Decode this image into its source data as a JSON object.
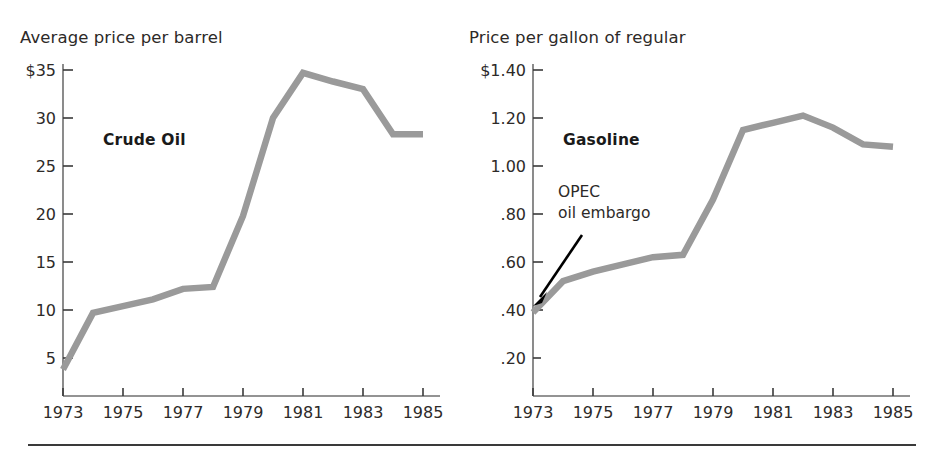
{
  "figure": {
    "background_color": "#ffffff",
    "line_color": "#9a9a9a",
    "text_color": "#2d2a28",
    "rule_color": "#3a3a3a"
  },
  "panels": [
    {
      "key": "crude",
      "title": "Average price per barrel",
      "series_label": "Crude Oil",
      "y_tick_labels": [
        "$35",
        "30",
        "25",
        "20",
        "15",
        "10",
        "5"
      ],
      "x_tick_labels": [
        "1973",
        "1975",
        "1977",
        "1979",
        "1981",
        "1983",
        "1985"
      ]
    },
    {
      "key": "gasoline",
      "title": "Price per gallon of regular",
      "series_label": "Gasoline",
      "annotation_line_1": "OPEC",
      "annotation_line_2": "oil embargo",
      "y_tick_labels": [
        "$1.40",
        "1.20",
        "1.00",
        ".80",
        ".60",
        ".40",
        ".20"
      ],
      "x_tick_labels": [
        "1973",
        "1975",
        "1977",
        "1979",
        "1981",
        "1983",
        "1985"
      ]
    }
  ],
  "chart_data": [
    {
      "type": "line",
      "title": "Average price per barrel",
      "series_name": "Crude Oil",
      "xlabel": "",
      "ylabel": "Average price per barrel",
      "x": [
        1973,
        1974,
        1975,
        1976,
        1977,
        1978,
        1979,
        1980,
        1981,
        1982,
        1983,
        1984,
        1985
      ],
      "values": [
        3.8,
        9.7,
        10.4,
        11.1,
        12.2,
        12.4,
        19.8,
        30.0,
        34.7,
        33.8,
        33.0,
        28.3,
        28.3
      ],
      "x_ticks": [
        1973,
        1975,
        1977,
        1979,
        1981,
        1983,
        1985
      ],
      "x_tick_labels": [
        "1973",
        "1975",
        "1977",
        "1979",
        "1981",
        "1983",
        "1985"
      ],
      "y_ticks": [
        5,
        10,
        15,
        20,
        25,
        30,
        35
      ],
      "y_tick_labels": [
        "5",
        "10",
        "15",
        "20",
        "25",
        "30",
        "$35"
      ],
      "xlim": [
        1973,
        1985
      ],
      "ylim": [
        0,
        35
      ],
      "grid": false,
      "legend": "none",
      "annotations": []
    },
    {
      "type": "line",
      "title": "Price per gallon of regular",
      "series_name": "Gasoline",
      "xlabel": "",
      "ylabel": "Price per gallon of regular",
      "x": [
        1973,
        1974,
        1975,
        1976,
        1977,
        1978,
        1979,
        1980,
        1981,
        1982,
        1983,
        1984,
        1985
      ],
      "values": [
        0.39,
        0.52,
        0.56,
        0.59,
        0.62,
        0.63,
        0.86,
        1.15,
        1.18,
        1.21,
        1.16,
        1.09,
        1.08
      ],
      "x_ticks": [
        1973,
        1975,
        1977,
        1979,
        1981,
        1983,
        1985
      ],
      "x_tick_labels": [
        "1973",
        "1975",
        "1977",
        "1979",
        "1981",
        "1983",
        "1985"
      ],
      "y_ticks": [
        0.2,
        0.4,
        0.6,
        0.8,
        1.0,
        1.2,
        1.4
      ],
      "y_tick_labels": [
        ".20",
        ".40",
        ".60",
        ".80",
        "1.00",
        "1.20",
        "$1.40"
      ],
      "xlim": [
        1973,
        1985
      ],
      "ylim": [
        0,
        1.4
      ],
      "grid": false,
      "legend": "none",
      "annotations": [
        {
          "text": "OPEC oil embargo",
          "points_to_x": 1973,
          "points_to_y": 0.39
        }
      ]
    }
  ]
}
